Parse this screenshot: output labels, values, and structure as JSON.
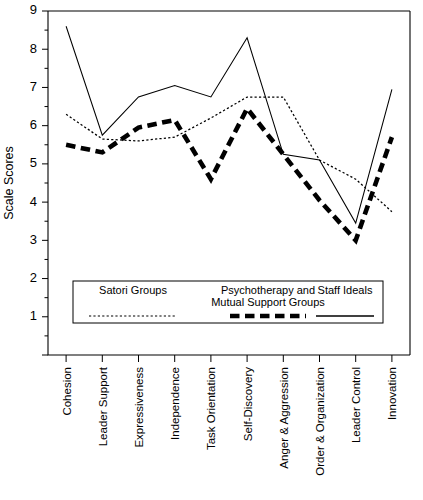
{
  "chart_data": {
    "type": "line",
    "title": "",
    "xlabel": "",
    "ylabel": "Scale Scores",
    "ylim": [
      0,
      9
    ],
    "yticks": [
      0,
      1,
      2,
      3,
      4,
      5,
      6,
      7,
      8,
      9
    ],
    "ytick_labels": [
      "",
      "1",
      "2",
      "3",
      "4",
      "5",
      "6",
      "7",
      "8",
      "9"
    ],
    "grid": false,
    "legend_position": "inside-bottom-center",
    "categories": [
      "Cohesion",
      "Leader Support",
      "Expressiveness",
      "Independence",
      "Task Orientation",
      "Self-Discovery",
      "Anger & Aggression",
      "Order & Organization",
      "Leader Control",
      "Innovation"
    ],
    "series": [
      {
        "name": "Satori Groups",
        "style": "dotted",
        "values": [
          6.3,
          5.65,
          5.6,
          5.7,
          6.2,
          6.75,
          6.75,
          5.1,
          4.6,
          3.75
        ]
      },
      {
        "name": "Psychotherapy and Mutual Support Groups",
        "style": "dashed",
        "values": [
          5.5,
          5.3,
          5.95,
          6.15,
          4.6,
          6.45,
          5.25,
          4.05,
          3.0,
          5.7
        ]
      },
      {
        "name": "Staff Ideals",
        "style": "solid",
        "values": [
          8.6,
          5.75,
          6.75,
          7.05,
          6.75,
          8.3,
          5.25,
          5.1,
          3.45,
          6.95
        ]
      }
    ]
  },
  "legend": {
    "entries": [
      {
        "label_line1": "Satori Groups",
        "label_line2": "",
        "style": "dotted"
      },
      {
        "label_line1": "Psychotherapy and",
        "label_line2": "Mutual Support Groups",
        "style": "dashed"
      },
      {
        "label_line1": "Staff Ideals",
        "label_line2": "",
        "style": "solid"
      }
    ]
  },
  "colors": {
    "ink": "#000000",
    "background": "#ffffff"
  }
}
